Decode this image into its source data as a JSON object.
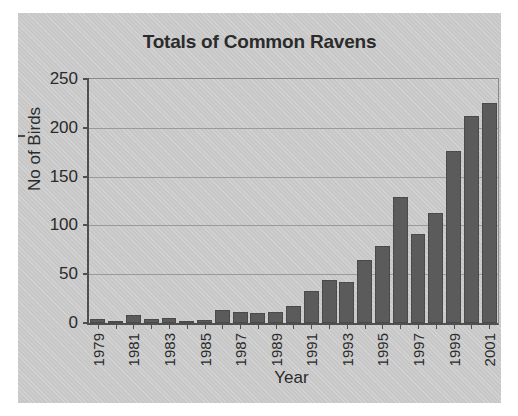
{
  "chart_data": {
    "type": "bar",
    "title": "Totals of Common Ravens",
    "xlabel": "Year",
    "ylabel": "No of Birds",
    "ylim": [
      0,
      250
    ],
    "yticks": [
      0,
      50,
      100,
      150,
      200,
      250
    ],
    "grid": true,
    "legend": "none",
    "categories": [
      "1979",
      "1980",
      "1981",
      "1982",
      "1983",
      "1984",
      "1985",
      "1986",
      "1987",
      "1988",
      "1989",
      "1990",
      "1991",
      "1992",
      "1993",
      "1994",
      "1995",
      "1996",
      "1997",
      "1998",
      "1999",
      "2000",
      "2001"
    ],
    "tick_labels": [
      "1979",
      "",
      "1981",
      "",
      "1983",
      "",
      "1985",
      "",
      "1987",
      "",
      "1989",
      "",
      "1991",
      "",
      "1993",
      "",
      "1995",
      "",
      "1997",
      "",
      "1999",
      "",
      "2001"
    ],
    "values": [
      4,
      1,
      8,
      4,
      5,
      2,
      3,
      13,
      11,
      10,
      11,
      17,
      33,
      44,
      42,
      65,
      79,
      129,
      91,
      113,
      176,
      212,
      225
    ]
  },
  "colors": {
    "bar": "#5b5b5b",
    "figure_background": "#cdcdcd",
    "axis": "#4f4f4f",
    "gridline": "#9a9a9a",
    "text": "#2b2b2b"
  }
}
